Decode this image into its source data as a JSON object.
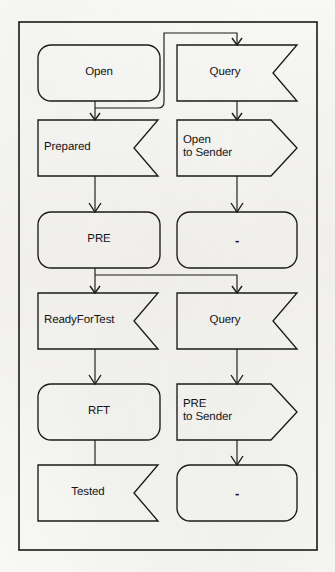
{
  "diagram": {
    "background_color": "#fbfbf9",
    "stroke_color": "#1a1a1a",
    "text_color": "#151515",
    "columns": [
      {
        "name": "left",
        "role": "state-and-signal-column"
      },
      {
        "name": "right",
        "role": "query-and-message-column"
      }
    ],
    "rows": [
      {
        "index": 0,
        "left": {
          "label": "Open",
          "shape": "rounded-rect",
          "align": "center"
        },
        "right": {
          "label": "Query",
          "shape": "notched-banner",
          "align": "center"
        }
      },
      {
        "index": 1,
        "left": {
          "label": "Prepared",
          "shape": "notched-banner",
          "align": "left"
        },
        "right": {
          "label": "Open\nto Sender",
          "shape": "arrow-pentagon",
          "align": "left"
        }
      },
      {
        "index": 2,
        "left": {
          "label": "PRE",
          "shape": "rounded-rect",
          "align": "center"
        },
        "right": {
          "label": "-",
          "shape": "rounded-rect",
          "align": "center"
        }
      },
      {
        "index": 3,
        "left": {
          "label": "ReadyForTest",
          "shape": "notched-banner",
          "align": "left"
        },
        "right": {
          "label": "Query",
          "shape": "notched-banner",
          "align": "center"
        }
      },
      {
        "index": 4,
        "left": {
          "label": "RFT",
          "shape": "rounded-rect",
          "align": "center"
        },
        "right": {
          "label": "PRE\nto Sender",
          "shape": "arrow-pentagon",
          "align": "left"
        }
      },
      {
        "index": 5,
        "left": {
          "label": "Tested",
          "shape": "notched-banner",
          "align": "center"
        },
        "right": {
          "label": "-",
          "shape": "rounded-rect",
          "align": "center"
        }
      }
    ],
    "connectors": [
      {
        "name": "open-to-prepared",
        "from": "Open",
        "to": "Prepared",
        "kind": "vertical-arrow"
      },
      {
        "name": "open-to-query-1",
        "from": "Open",
        "to": "Query",
        "kind": "routed-elbow"
      },
      {
        "name": "query1-to-open-to-sender",
        "from": "Query",
        "to": "Open to Sender",
        "kind": "vertical-arrow"
      },
      {
        "name": "prepared-to-pre",
        "from": "Prepared",
        "to": "PRE",
        "kind": "vertical-arrow"
      },
      {
        "name": "open-to-sender-to-dash",
        "from": "Open to Sender",
        "to": "-",
        "kind": "vertical-arrow"
      },
      {
        "name": "pre-to-readyfortest",
        "from": "PRE",
        "to": "ReadyForTest",
        "kind": "vertical-arrow"
      },
      {
        "name": "pre-to-query-2",
        "from": "PRE",
        "to": "Query",
        "kind": "routed-elbow"
      },
      {
        "name": "readyfortest-to-rft",
        "from": "ReadyForTest",
        "to": "RFT",
        "kind": "vertical-arrow"
      },
      {
        "name": "query2-to-pre-to-sender",
        "from": "Query",
        "to": "PRE to Sender",
        "kind": "vertical-arrow"
      },
      {
        "name": "rft-to-tested",
        "from": "RFT",
        "to": "Tested",
        "kind": "vertical-arrow"
      },
      {
        "name": "pre-to-sender-to-dash",
        "from": "PRE to Sender",
        "to": "-",
        "kind": "vertical-arrow"
      }
    ]
  },
  "labels": {
    "r0": {
      "left": "Open",
      "right": "Query"
    },
    "r1": {
      "left": "Prepared",
      "right": "Open\nto Sender"
    },
    "r2": {
      "left": "PRE",
      "right": "-"
    },
    "r3": {
      "left": "ReadyForTest",
      "right": "Query"
    },
    "r4": {
      "left": "RFT",
      "right": "PRE\nto Sender"
    },
    "r5": {
      "left": "Tested",
      "right": "-"
    }
  }
}
